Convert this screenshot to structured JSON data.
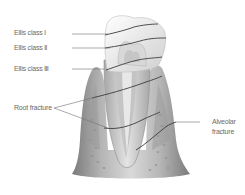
{
  "figure": {
    "labels": {
      "ellis1": "Ellis class Ⅰ",
      "ellis2": "Ellis class Ⅱ",
      "ellis3": "Ellis class Ⅲ",
      "root_fracture": "Root fracture",
      "alveolar_line1": "Alveolar",
      "alveolar_line2": "fracture"
    },
    "colors": {
      "leader_line": "#6e6e6e",
      "fracture_line": "#3c3c3c",
      "enamel": "#f2f2f2",
      "dentin": "#d4d4d4",
      "pulp": "#bdbdbd",
      "gum": "#8a8a8a",
      "bone": "#c8c8c8",
      "text": "#6a6a6a"
    }
  }
}
